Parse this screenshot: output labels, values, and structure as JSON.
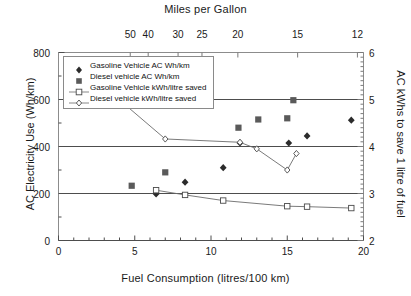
{
  "chart_data": {
    "type": "scatter",
    "title": "Miles per Gallon",
    "xlabel": "Fuel Consumption (litres/100 km)",
    "ylabel": "AC Electricity Use (Wh/km)",
    "ylabel_right": "AC kWhs to save 1 litre of fuel",
    "xlim": [
      0,
      20
    ],
    "ylim": [
      0,
      800
    ],
    "ylim_right": [
      2,
      6
    ],
    "grid": "horizontal-major-left-axis",
    "legend_position": "top-left-inside",
    "x_ticks": [
      "0",
      "5",
      "10",
      "15",
      "20"
    ],
    "x_tick_values": [
      0,
      5,
      10,
      15,
      20
    ],
    "y_ticks_left": [
      "0",
      "200",
      "400",
      "600",
      "800"
    ],
    "y_tick_values_left": [
      0,
      200,
      400,
      600,
      800
    ],
    "y_ticks_right": [
      "2",
      "3",
      "4",
      "5",
      "6"
    ],
    "y_tick_values_right": [
      2,
      3,
      4,
      5,
      6
    ],
    "top_axis_ticks": [
      "50",
      "40",
      "30",
      "25",
      "20",
      "15",
      "12"
    ],
    "top_axis_tick_values": [
      50,
      40,
      30,
      25,
      20,
      15,
      12
    ],
    "series": [
      {
        "name": "Gasoline Vehicle AC Wh/km",
        "axis": "left",
        "marker": "filled-diamond",
        "color": "#2b2b2b",
        "line": false,
        "points": [
          {
            "x": 6.4,
            "y": 198
          },
          {
            "x": 8.3,
            "y": 248
          },
          {
            "x": 10.8,
            "y": 310
          },
          {
            "x": 11.9,
            "y": 415
          },
          {
            "x": 15.1,
            "y": 415
          },
          {
            "x": 16.3,
            "y": 445
          },
          {
            "x": 19.2,
            "y": 512
          }
        ]
      },
      {
        "name": "Diesel vehicle AC Wh/km",
        "axis": "left",
        "marker": "filled-square",
        "color": "#5a5a5a",
        "line": false,
        "points": [
          {
            "x": 4.8,
            "y": 233
          },
          {
            "x": 7.0,
            "y": 290
          },
          {
            "x": 11.8,
            "y": 480
          },
          {
            "x": 13.1,
            "y": 515
          },
          {
            "x": 15.0,
            "y": 520
          },
          {
            "x": 15.4,
            "y": 597
          }
        ]
      },
      {
        "name": "Gasoline Vehicle kWh/litre saved",
        "axis": "right",
        "marker": "open-square",
        "color": "#6b6b6b",
        "line": true,
        "points": [
          {
            "x": 6.4,
            "y": 3.07
          },
          {
            "x": 8.3,
            "y": 2.97
          },
          {
            "x": 10.8,
            "y": 2.85
          },
          {
            "x": 15.0,
            "y": 2.73
          },
          {
            "x": 16.3,
            "y": 2.72
          },
          {
            "x": 19.2,
            "y": 2.69
          }
        ]
      },
      {
        "name": "Diesel vehicle kWh/litre saved",
        "axis": "right",
        "marker": "open-diamond",
        "color": "#6b6b6b",
        "line": true,
        "points": [
          {
            "x": 4.4,
            "y": 4.88
          },
          {
            "x": 7.0,
            "y": 4.16
          },
          {
            "x": 11.9,
            "y": 4.09
          },
          {
            "x": 13.0,
            "y": 3.95
          },
          {
            "x": 15.0,
            "y": 3.5
          },
          {
            "x": 15.6,
            "y": 3.85
          }
        ]
      }
    ],
    "legend_entries": [
      "Gasoline Vehicle AC Wh/km",
      "Diesel vehicle AC Wh/km",
      "Gasoline Vehicle kWh/litre saved",
      "Diesel vehicle kWh/litre saved"
    ]
  }
}
